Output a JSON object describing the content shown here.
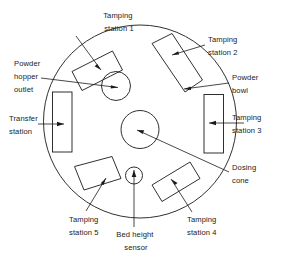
{
  "diagram": {
    "background_color": "#ffffff",
    "line_color": "#1a1a1a",
    "main_disc": {
      "name": "dosing disc",
      "cx": 140,
      "cy": 121.5,
      "r": 96.5
    },
    "labels": {
      "tamping_station_1": {
        "line1": "Tamping",
        "line2": "station 1"
      },
      "tamping_station_2": {
        "line1": "Tamping",
        "line2": "station 2"
      },
      "tamping_station_3": {
        "line1": "Tamping",
        "line2": "station 3"
      },
      "tamping_station_4": {
        "line1": "Tamping",
        "line2": "station 4"
      },
      "tamping_station_5": {
        "line1": "Tamping",
        "line2": "station 5"
      },
      "powder_hopper_outlet": {
        "line1": "Powder",
        "line2": "hopper",
        "line3": "outlet"
      },
      "powder_bowl": {
        "line1": "Powder",
        "line2": "bowl"
      },
      "transfer_station": {
        "line1": "Transfer",
        "line2": "station"
      },
      "dosing_cone": {
        "line1": "Dosing",
        "line2": "cone"
      },
      "bed_height_sensor": {
        "line1": "Bed height",
        "line2": "sensor"
      }
    },
    "parts": [
      {
        "id": "tamping-station-1",
        "type": "rotated-rectangle",
        "label": "Tamping station 1"
      },
      {
        "id": "tamping-station-2",
        "type": "rotated-rectangle",
        "label": "Tamping station 2"
      },
      {
        "id": "tamping-station-3",
        "type": "rectangle",
        "label": "Tamping station 3"
      },
      {
        "id": "tamping-station-4",
        "type": "rotated-rectangle",
        "label": "Tamping station 4"
      },
      {
        "id": "tamping-station-5",
        "type": "rotated-rectangle",
        "label": "Tamping station 5"
      },
      {
        "id": "transfer-station",
        "type": "rectangle",
        "label": "Transfer station"
      },
      {
        "id": "powder-hopper-outlet",
        "type": "circle",
        "label": "Powder hopper outlet"
      },
      {
        "id": "dosing-cone",
        "type": "circle",
        "label": "Dosing cone"
      },
      {
        "id": "bed-height-sensor",
        "type": "circle",
        "label": "Bed height sensor"
      },
      {
        "id": "powder-bowl",
        "type": "disc-edge",
        "label": "Powder bowl"
      }
    ]
  }
}
